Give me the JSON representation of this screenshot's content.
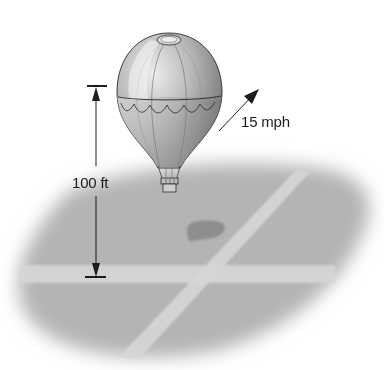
{
  "diagram": {
    "height_label": "100 ft",
    "speed_label": "15 mph",
    "colors": {
      "background": "#ffffff",
      "ground": "#b4b4b4",
      "road": "#d6d6d6",
      "shadow": "#8e8e8e",
      "balloon_light": "#e2e2e2",
      "balloon_mid": "#a8a8a8",
      "balloon_dark": "#6e6e6e",
      "line": "#1c1c1c"
    }
  }
}
